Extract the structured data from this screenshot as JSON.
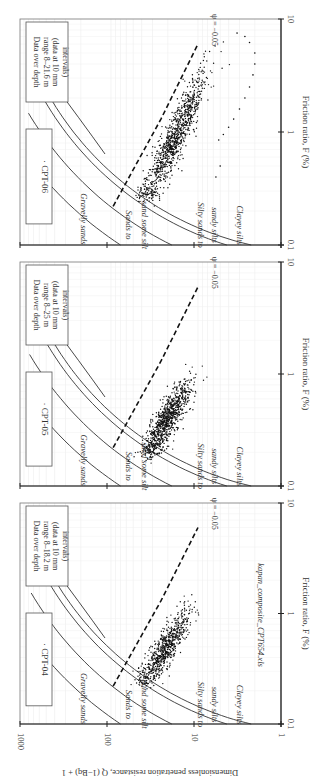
{
  "chart_data": {
    "type": "scatter",
    "orientation": "rotated 90 degrees (figure printed sideways)",
    "xlabel": "Friction ratio, F (%)",
    "ylabel": "Dimensionless penetration resistance, Q (1-Bq) + 1",
    "xscale": "log",
    "yscale": "log",
    "xlim": [
      0.1,
      10
    ],
    "ylim": [
      1,
      1000
    ],
    "x_ticks": [
      "0.1",
      "1",
      "10"
    ],
    "y_ticks": [
      "1",
      "10",
      "100",
      "1000"
    ],
    "zone_labels": [
      "Gravelly sands",
      "Sands to sand some silt",
      "Silty sands to sandy silts",
      "Clayey silts"
    ],
    "state_line_label": "ψ = −0.05",
    "source_note": "kapan_composite_CPT654.xls",
    "panels": [
      {
        "id": "CPT-04",
        "legend": "· CPT-04",
        "note": [
          "Data over depth",
          "range 8–18.2 m",
          "(data at 10 mm",
          "intervals)"
        ],
        "cloud": {
          "F_center": 0.55,
          "Q_center": 22,
          "F_range": [
            0.25,
            1.5
          ],
          "Q_range": [
            9,
            35
          ],
          "n": 700
        },
        "outliers": []
      },
      {
        "id": "CPT-05",
        "legend": "· CPT-05",
        "note": [
          "Data over depth",
          "range 8–25 m",
          "(data at 10 mm",
          "intervals)"
        ],
        "cloud": {
          "F_center": 0.45,
          "Q_center": 20,
          "F_range": [
            0.2,
            1.3
          ],
          "Q_range": [
            9,
            32
          ],
          "n": 900
        },
        "outliers": []
      },
      {
        "id": "CPT-06",
        "legend": "· CPT-06",
        "note": [
          "Data over depth",
          "range 8–21.6 m",
          "(data at 10 mm",
          "intervals)"
        ],
        "cloud": {
          "F_center": 0.8,
          "Q_center": 16,
          "F_range": [
            0.28,
            6.5
          ],
          "Q_range": [
            5,
            33
          ],
          "n": 1000
        },
        "outliers": [
          [
            7.5,
            3.2
          ],
          [
            7.0,
            2.6
          ],
          [
            6.2,
            2.3
          ],
          [
            5.0,
            2.0
          ],
          [
            4.0,
            2.0
          ],
          [
            3.2,
            2.1
          ],
          [
            2.5,
            2.3
          ],
          [
            2.0,
            2.6
          ],
          [
            1.6,
            3.0
          ],
          [
            1.3,
            3.5
          ],
          [
            1.1,
            4.0
          ],
          [
            0.95,
            4.6
          ],
          [
            0.85,
            5.2
          ],
          [
            0.5,
            5.0
          ],
          [
            0.4,
            5.6
          ]
        ]
      }
    ],
    "boundaries_Q_at_Fmin": [
      70,
      18,
      4.2,
      2.2
    ],
    "title": "",
    "legend_position": "inside, top-left of each panel",
    "grid": true
  },
  "labels": {
    "xlabel": "Friction ratio, F (%)",
    "ylabel": "Dimensionless penetration resistance, Q (1−Bq) + 1",
    "source_note": "kapan_composite_CPT654.xls",
    "psi": "ψ = −0.05",
    "zones": {
      "gravelly": "Gravelly sands",
      "sands1": "Sands to",
      "sands2": "sand some silt",
      "silty1": "Silty sands to",
      "silty2": "sandy silts",
      "clayey": "Clayey silts"
    }
  }
}
